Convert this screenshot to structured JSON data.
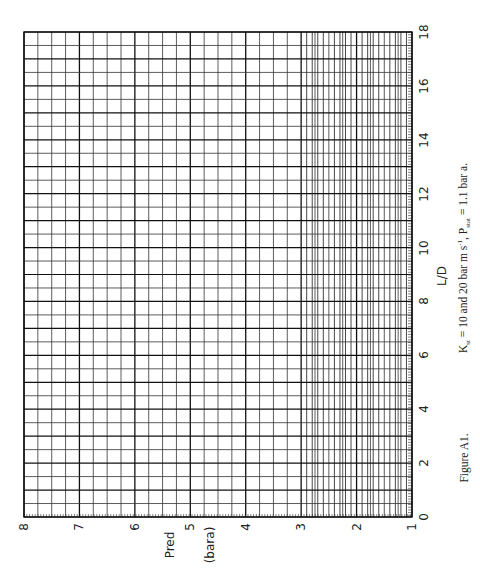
{
  "chart_data": {
    "type": "line",
    "title": "",
    "orientation": "rotated-90-ccw",
    "grid": true,
    "series": [],
    "xaxis": {
      "label": "L/D",
      "range": [
        0,
        18
      ],
      "ticks": [
        0,
        2,
        4,
        6,
        8,
        10,
        12,
        14,
        16,
        18
      ],
      "tick_labels": [
        "0",
        "2",
        "4",
        "6",
        "8",
        "10",
        "12",
        "14",
        "16",
        "18"
      ],
      "minor_step": 0.5
    },
    "yaxis": {
      "label": "Pred",
      "units": "(bara)",
      "range": [
        1,
        8
      ],
      "ticks": [
        1,
        2,
        3,
        4,
        5,
        6,
        7,
        8
      ],
      "tick_labels": [
        "1",
        "2",
        "3",
        "4",
        "5",
        "6",
        "7",
        "8"
      ],
      "minor_step": 0.25
    },
    "caption": "Figure A1.   Kst = 10 and 20 bar m s-1, Pstat = 1.1 bar a."
  },
  "labels": {
    "pred": "Pred",
    "bara": "(bara)",
    "ld": "L/D",
    "figure": "Figure A1.",
    "caption_k": "K",
    "caption_k_sub": "st",
    "caption_mid": " = 10 and 20 bar m s",
    "caption_sup": "-1",
    "caption_p": ", P",
    "caption_p_sub": "stat",
    "caption_end": " = 1.1 bar a."
  },
  "style": {
    "grid_color": "#333333",
    "bold_color": "#111111",
    "background": "#ffffff"
  }
}
